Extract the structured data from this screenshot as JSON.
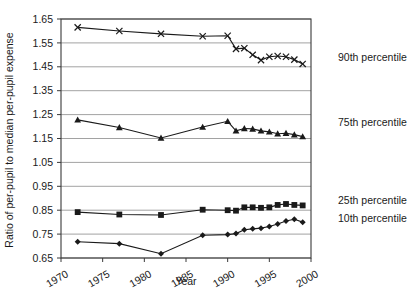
{
  "chart_data": {
    "type": "line",
    "title": "",
    "xlabel": "Year",
    "ylabel": "Ratio of per-pupil to median per-pupil expense",
    "xlim": [
      1970,
      2000
    ],
    "ylim": [
      0.65,
      1.65
    ],
    "xticks": [
      1970,
      1975,
      1980,
      1985,
      1990,
      1995,
      2000
    ],
    "xtick_labels": [
      "1970",
      "1975",
      "1980",
      "1985",
      "1990",
      "1995",
      "2000"
    ],
    "yticks": [
      0.65,
      0.75,
      0.85,
      0.95,
      1.05,
      1.15,
      1.25,
      1.35,
      1.45,
      1.55,
      1.65
    ],
    "ytick_labels": [
      "0.65",
      "0.75",
      "0.85",
      "0.95",
      "1.05",
      "1.15",
      "1.25",
      "1.35",
      "1.45",
      "1.55",
      "1.65"
    ],
    "grid": true,
    "grid_axis": "y",
    "legend_position": "right-inline",
    "series": [
      {
        "name": "90th percentile",
        "label": "90th percentile",
        "marker": "x",
        "color": "#1a1a1a",
        "x": [
          1972,
          1977,
          1982,
          1987,
          1990,
          1991,
          1992,
          1993,
          1994,
          1995,
          1996,
          1997,
          1998,
          1999
        ],
        "values": [
          1.615,
          1.6,
          1.588,
          1.578,
          1.58,
          1.525,
          1.528,
          1.5,
          1.478,
          1.492,
          1.495,
          1.492,
          1.48,
          1.462
        ]
      },
      {
        "name": "75th percentile",
        "label": "75th percentile",
        "marker": "triangle",
        "color": "#1a1a1a",
        "x": [
          1972,
          1977,
          1982,
          1987,
          1990,
          1991,
          1992,
          1993,
          1994,
          1995,
          1996,
          1997,
          1998,
          1999
        ],
        "values": [
          1.228,
          1.196,
          1.152,
          1.198,
          1.222,
          1.182,
          1.192,
          1.19,
          1.182,
          1.178,
          1.17,
          1.172,
          1.166,
          1.158
        ]
      },
      {
        "name": "25th percentile",
        "label": "25th percentile",
        "marker": "square",
        "color": "#1a1a1a",
        "x": [
          1972,
          1977,
          1982,
          1987,
          1990,
          1991,
          1992,
          1993,
          1994,
          1995,
          1996,
          1997,
          1998,
          1999
        ],
        "values": [
          0.842,
          0.832,
          0.83,
          0.852,
          0.85,
          0.848,
          0.862,
          0.862,
          0.86,
          0.862,
          0.872,
          0.876,
          0.872,
          0.87
        ]
      },
      {
        "name": "10th percentile",
        "label": "10th percentile",
        "marker": "diamond",
        "color": "#1a1a1a",
        "x": [
          1972,
          1977,
          1982,
          1987,
          1990,
          1991,
          1992,
          1993,
          1994,
          1995,
          1996,
          1997,
          1998,
          1999
        ],
        "values": [
          0.718,
          0.71,
          0.668,
          0.745,
          0.748,
          0.752,
          0.768,
          0.772,
          0.775,
          0.782,
          0.792,
          0.805,
          0.812,
          0.8
        ]
      }
    ]
  }
}
